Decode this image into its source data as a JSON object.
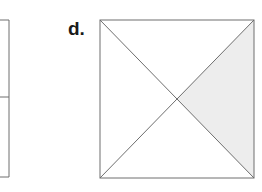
{
  "page": {
    "width": 262,
    "height": 192,
    "background_color": "#ffffff"
  },
  "figure": {
    "part_label": "d.",
    "stroke_color": "#6e6e6e",
    "stroke_width": 1,
    "shaded_fill_color": "#ededed",
    "unshaded_fill_color": "#ffffff",
    "square": {
      "left": 100,
      "top": 20,
      "right": 254,
      "bottom": 178,
      "center_x": 177,
      "center_y": 99
    },
    "regions": [
      {
        "name": "top-triangle",
        "shaded": false
      },
      {
        "name": "left-triangle",
        "shaded": false
      },
      {
        "name": "bottom-triangle",
        "shaded": false
      },
      {
        "name": "right-triangle",
        "shaded": true
      }
    ],
    "shaded_count": 1,
    "total_parts": 4,
    "fraction_shaded": "1/4"
  },
  "partial_figure": {
    "description": "Cropped rectangle fragment at the left edge of the image, divided by a horizontal line.",
    "stroke_color": "#6e6e6e",
    "right_edge_x": 9,
    "top_y": 20,
    "bottom_y": 177,
    "divider_y": 97
  }
}
